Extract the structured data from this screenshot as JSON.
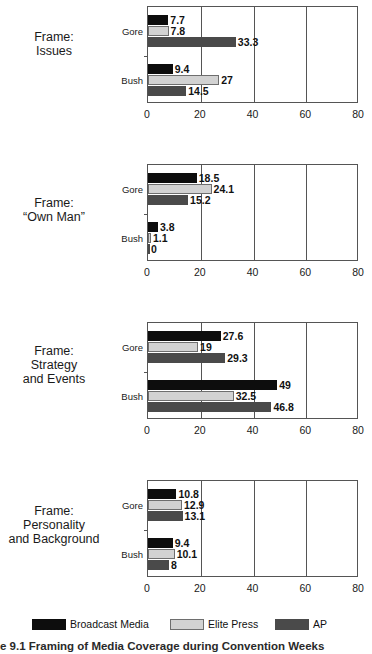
{
  "chart_data": [
    {
      "type": "bar",
      "orientation": "horizontal",
      "title": "Frame: Issues",
      "title_lines": [
        "Frame:",
        "Issues"
      ],
      "categories": [
        "Gore",
        "Bush"
      ],
      "series": [
        {
          "name": "Broadcast Media",
          "color": "#0d0d0d",
          "values": [
            7.7,
            9.4
          ]
        },
        {
          "name": "Elite Press",
          "color": "#d2d2d2",
          "values": [
            7.8,
            27
          ]
        },
        {
          "name": "AP",
          "color": "#4a4a4a",
          "values": [
            33.3,
            14.5
          ]
        }
      ],
      "value_labels": [
        [
          "7.7",
          "7.8",
          "33.3"
        ],
        [
          "9.4",
          "27",
          "14.5"
        ]
      ],
      "xlabel": "",
      "ylabel": "",
      "xlim": [
        0,
        80
      ],
      "xticks": [
        0,
        20,
        40,
        60,
        80
      ],
      "xtick_labels": [
        "0",
        "20",
        "40",
        "60",
        "80"
      ],
      "grid": true,
      "legend_position": "bottom"
    },
    {
      "type": "bar",
      "orientation": "horizontal",
      "title": "Frame: “Own Man”",
      "title_lines": [
        "Frame:",
        "“Own Man”"
      ],
      "categories": [
        "Gore",
        "Bush"
      ],
      "series": [
        {
          "name": "Broadcast Media",
          "color": "#0d0d0d",
          "values": [
            18.5,
            3.8
          ]
        },
        {
          "name": "Elite Press",
          "color": "#d2d2d2",
          "values": [
            24.1,
            1.1
          ]
        },
        {
          "name": "AP",
          "color": "#4a4a4a",
          "values": [
            15.2,
            0
          ]
        }
      ],
      "value_labels": [
        [
          "18.5",
          "24.1",
          "15.2"
        ],
        [
          "3.8",
          "1.1",
          "0"
        ]
      ],
      "xlabel": "",
      "ylabel": "",
      "xlim": [
        0,
        80
      ],
      "xticks": [
        0,
        20,
        40,
        60,
        80
      ],
      "xtick_labels": [
        "0",
        "20",
        "40",
        "60",
        "80"
      ],
      "grid": true,
      "legend_position": "bottom"
    },
    {
      "type": "bar",
      "orientation": "horizontal",
      "title": "Frame: Strategy and Events",
      "title_lines": [
        "Frame:",
        "Strategy",
        "and Events"
      ],
      "categories": [
        "Gore",
        "Bush"
      ],
      "series": [
        {
          "name": "Broadcast Media",
          "color": "#0d0d0d",
          "values": [
            27.6,
            49
          ]
        },
        {
          "name": "Elite Press",
          "color": "#d2d2d2",
          "values": [
            19,
            32.5
          ]
        },
        {
          "name": "AP",
          "color": "#4a4a4a",
          "values": [
            29.3,
            46.8
          ]
        }
      ],
      "value_labels": [
        [
          "27.6",
          "19",
          "29.3"
        ],
        [
          "49",
          "32.5",
          "46.8"
        ]
      ],
      "xlabel": "",
      "ylabel": "",
      "xlim": [
        0,
        80
      ],
      "xticks": [
        0,
        20,
        40,
        60,
        80
      ],
      "xtick_labels": [
        "0",
        "20",
        "40",
        "60",
        "80"
      ],
      "grid": true,
      "legend_position": "bottom"
    },
    {
      "type": "bar",
      "orientation": "horizontal",
      "title": "Frame: Personality and Background",
      "title_lines": [
        "Frame:",
        "Personality",
        "and Background"
      ],
      "categories": [
        "Gore",
        "Bush"
      ],
      "series": [
        {
          "name": "Broadcast Media",
          "color": "#0d0d0d",
          "values": [
            10.8,
            9.4
          ]
        },
        {
          "name": "Elite Press",
          "color": "#d2d2d2",
          "values": [
            12.9,
            10.1
          ]
        },
        {
          "name": "AP",
          "color": "#4a4a4a",
          "values": [
            13.1,
            8
          ]
        }
      ],
      "value_labels": [
        [
          "10.8",
          "12.9",
          "13.1"
        ],
        [
          "9.4",
          "10.1",
          "8"
        ]
      ],
      "xlabel": "",
      "ylabel": "",
      "xlim": [
        0,
        80
      ],
      "xticks": [
        0,
        20,
        40,
        60,
        80
      ],
      "xtick_labels": [
        "0",
        "20",
        "40",
        "60",
        "80"
      ],
      "grid": true,
      "legend_position": "bottom"
    }
  ],
  "legend": {
    "items": [
      {
        "label": "Broadcast Media",
        "key": "broadcast",
        "color": "#0d0d0d",
        "x": 32
      },
      {
        "label": "Elite Press",
        "key": "elite",
        "color": "#d2d2d2",
        "x": 170
      },
      {
        "label": "AP",
        "key": "ap",
        "color": "#4a4a4a",
        "x": 275
      }
    ]
  },
  "caption": {
    "text": "e 9.1  Framing of Media Coverage during Convention Weeks"
  },
  "layout": {
    "panel_tops": [
      0,
      158,
      316,
      474
    ],
    "plot_top": 6,
    "plot_height": 97,
    "label_top_offsets": [
      30,
      38,
      28,
      30
    ]
  }
}
